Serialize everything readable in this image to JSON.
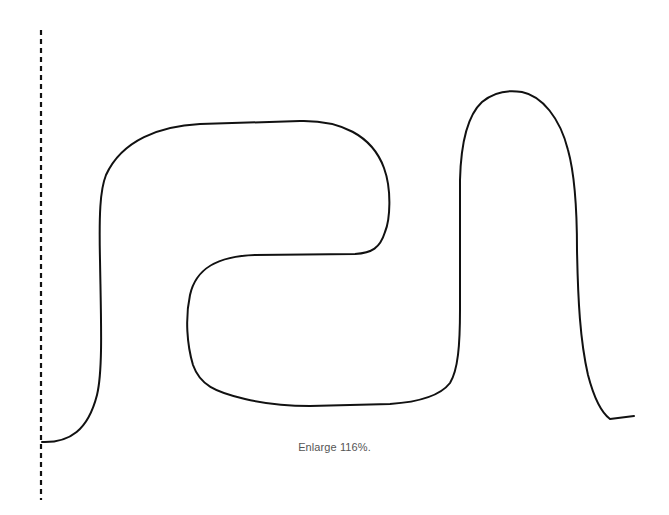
{
  "caption": "Enlarge 116%.",
  "colors": {
    "background": "#ffffff",
    "stroke": "#111111",
    "caption": "#555555"
  },
  "diagram": {
    "type": "line-drawing",
    "elements": [
      {
        "kind": "dashed-vertical-line",
        "x": 41,
        "y_start": 30,
        "y_end": 500
      },
      {
        "kind": "serpentine-curve",
        "start": [
          42,
          442
        ],
        "end": [
          634,
          417
        ]
      }
    ]
  }
}
